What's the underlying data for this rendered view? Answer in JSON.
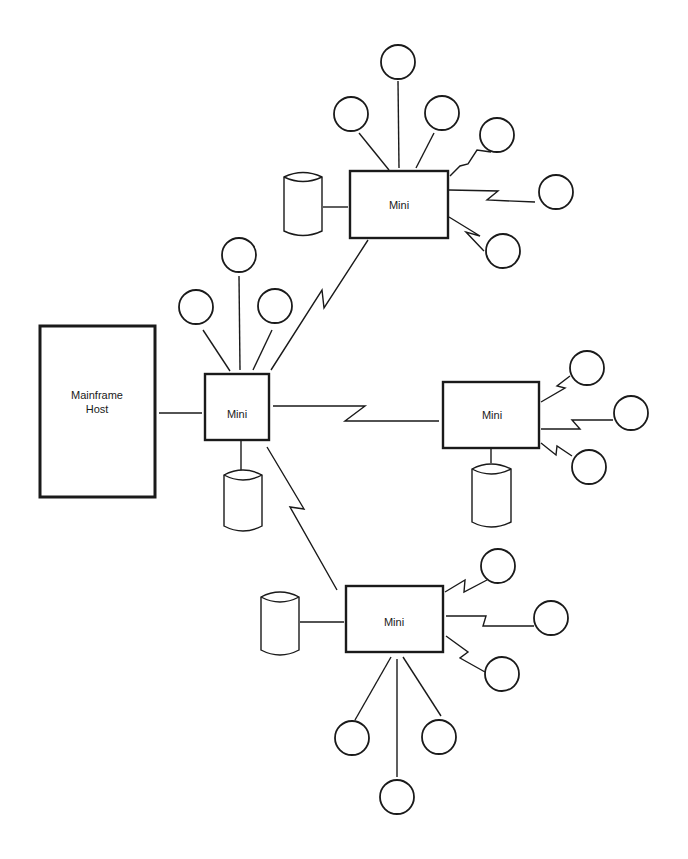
{
  "diagram": {
    "title": "",
    "colors": {
      "line": "#1a1a1a",
      "background": "#ffffff"
    },
    "nodes": {
      "mainframe": {
        "label_line1": "Mainframe",
        "label_line2": "Host",
        "type": "host"
      },
      "mini_center": {
        "label": "Mini",
        "type": "minicomputer"
      },
      "mini_top": {
        "label": "Mini",
        "type": "minicomputer"
      },
      "mini_right": {
        "label": "Mini",
        "type": "minicomputer"
      },
      "mini_bottom": {
        "label": "Mini",
        "type": "minicomputer"
      }
    },
    "legend": {
      "circle": "terminal",
      "cylinder": "disk storage",
      "zigzag": "remote (telecommunication) link",
      "straight": "local link"
    },
    "edges": [
      {
        "from": "mainframe",
        "to": "mini_center",
        "style": "straight"
      },
      {
        "from": "mini_center",
        "to": "mini_top",
        "style": "zigzag"
      },
      {
        "from": "mini_center",
        "to": "mini_right",
        "style": "zigzag"
      },
      {
        "from": "mini_center",
        "to": "mini_bottom",
        "style": "zigzag"
      }
    ],
    "attachments": {
      "mini_center": {
        "terminals_local": 3,
        "terminals_remote": 0,
        "disks": 1
      },
      "mini_top": {
        "terminals_local": 3,
        "terminals_remote": 3,
        "disks": 1
      },
      "mini_right": {
        "terminals_local": 0,
        "terminals_remote": 3,
        "disks": 1
      },
      "mini_bottom": {
        "terminals_local": 3,
        "terminals_remote": 3,
        "disks": 1
      }
    }
  }
}
